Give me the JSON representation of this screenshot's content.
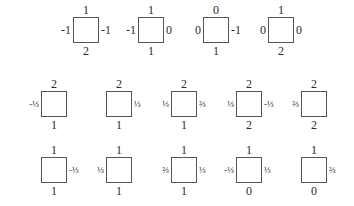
{
  "diagram": {
    "rows": [
      {
        "y": 17,
        "squares": [
          {
            "x": 73,
            "top": "1",
            "bottom": "2",
            "left": "-1",
            "right": "-1"
          },
          {
            "x": 138,
            "top": "1",
            "bottom": "1",
            "left": "-1",
            "right": "0"
          },
          {
            "x": 203,
            "top": "0",
            "bottom": "1",
            "left": "0",
            "right": "-1"
          },
          {
            "x": 268,
            "top": "1",
            "bottom": "2",
            "left": "0",
            "right": "0"
          }
        ]
      },
      {
        "y": 91,
        "squares": [
          {
            "x": 41,
            "top": "2",
            "bottom": "1",
            "left": "-⅓",
            "right": ""
          },
          {
            "x": 106,
            "top": "2",
            "bottom": "1",
            "left": "",
            "right": "⅓"
          },
          {
            "x": 171,
            "top": "2",
            "bottom": "1",
            "left": "⅓",
            "right": "⅔"
          },
          {
            "x": 236,
            "top": "2",
            "bottom": "2",
            "left": "⅓",
            "right": "-⅓"
          },
          {
            "x": 301,
            "top": "2",
            "bottom": "2",
            "left": "⅔",
            "right": ""
          }
        ]
      },
      {
        "y": 157,
        "squares": [
          {
            "x": 41,
            "top": "1",
            "bottom": "1",
            "left": "",
            "right": "-⅓"
          },
          {
            "x": 106,
            "top": "1",
            "bottom": "1",
            "left": "⅓",
            "right": ""
          },
          {
            "x": 171,
            "top": "1",
            "bottom": "1",
            "left": "⅔",
            "right": "⅓"
          },
          {
            "x": 236,
            "top": "1",
            "bottom": "0",
            "left": "-⅓",
            "right": "⅓"
          },
          {
            "x": 301,
            "top": "1",
            "bottom": "0",
            "left": "",
            "right": "⅔"
          }
        ]
      }
    ]
  }
}
